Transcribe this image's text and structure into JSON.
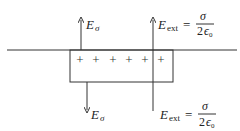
{
  "diagram": {
    "charges": {
      "symbol": "+",
      "count": 6
    },
    "labels": {
      "e_sigma_top": {
        "main": "E",
        "sub": "σ"
      },
      "e_ext_top": {
        "main": "E",
        "sub": "ext",
        "equals": "=",
        "numerator": "σ",
        "denominator_coef": "2",
        "denominator_sym": "ϵ",
        "denominator_sub": "0"
      },
      "e_sigma_bottom": {
        "main": "E",
        "sub": "σ"
      },
      "e_ext_bottom": {
        "main": "E",
        "sub": "ext",
        "equals": "=",
        "numerator": "σ",
        "denominator_coef": "2",
        "denominator_sym": "ϵ",
        "denominator_sub": "0"
      }
    },
    "plus_signs": [
      "+",
      "+",
      "+",
      "+",
      "+",
      "+"
    ],
    "colors": {
      "line": "#333333",
      "text": "#222222",
      "background": "#ffffff"
    }
  }
}
